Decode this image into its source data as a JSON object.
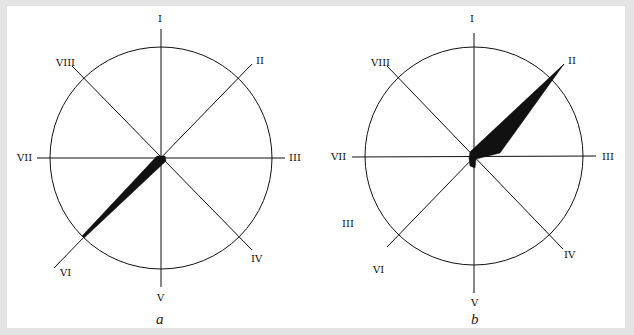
{
  "figure": {
    "panels": [
      {
        "id": "a",
        "caption": "a",
        "center": [
          161,
          158
        ],
        "radius": 110,
        "axis_labels": {
          "I": "I",
          "II": "II",
          "III": "III",
          "IV": "IV",
          "V": "V",
          "VI": "VI",
          "VII": "VII",
          "VIII": "VIII"
        },
        "hand": "thin wedge pointing toward VI"
      },
      {
        "id": "b",
        "caption": "b",
        "center": [
          474,
          157
        ],
        "radius": 110,
        "axis_labels": {
          "I": "I",
          "II": "II",
          "III": "III",
          "IV": "IV",
          "V": "V",
          "VI": "VI",
          "VII": "VII",
          "VIII": "VIII"
        },
        "extra_label": "III",
        "hand": "broad wedge pointing toward II"
      }
    ],
    "colors": {
      "background": "#e4e4e4",
      "panel": "#ffffff",
      "ink": "#111111"
    }
  }
}
